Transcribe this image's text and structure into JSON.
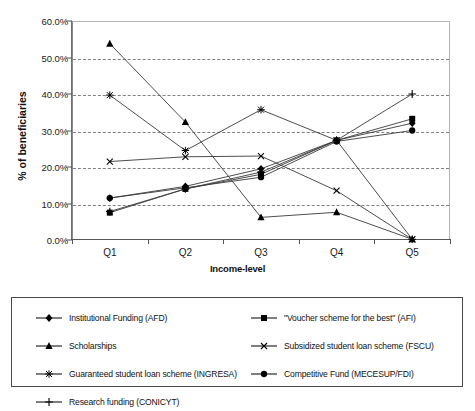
{
  "chart_data": {
    "type": "line",
    "title": "",
    "xlabel": "Income-level",
    "ylabel": "% of beneficiaries",
    "categories": [
      "Q1",
      "Q2",
      "Q3",
      "Q4",
      "Q5"
    ],
    "ylim": [
      0,
      60
    ],
    "ytick_labels": [
      "0.0%",
      "10.0%",
      "20.0%",
      "30.0%",
      "40.0%",
      "50.0%",
      "60.0%"
    ],
    "ytick_values": [
      0,
      10,
      20,
      30,
      40,
      50,
      60
    ],
    "grid": true,
    "legend_position": "bottom",
    "series": [
      {
        "name": "Institutional Funding (AFD)",
        "marker": "diamond",
        "values": [
          11.5,
          14.7,
          19.5,
          27.3,
          32.0
        ]
      },
      {
        "name": "\"Voucher scheme for the best\" (AFI)",
        "marker": "square",
        "values": [
          7.5,
          14.0,
          18.0,
          27.3,
          33.2
        ]
      },
      {
        "name": "Scholarships",
        "marker": "triangle",
        "values": [
          53.8,
          32.3,
          6.2,
          7.6,
          0.2
        ]
      },
      {
        "name": "Subsidized student loan scheme (FSCU)",
        "marker": "cross",
        "values": [
          21.5,
          22.8,
          23.0,
          13.5,
          0.2
        ]
      },
      {
        "name": "Guaranteed student loan scheme (INGRESA)",
        "marker": "star",
        "values": [
          39.7,
          24.5,
          35.7,
          27.3,
          0.2
        ]
      },
      {
        "name": "Competitive Fund (MECESUP/FDI)",
        "marker": "circle",
        "values": [
          11.5,
          14.3,
          17.2,
          27.0,
          30.0
        ]
      },
      {
        "name": "Research funding (CONICYT)",
        "marker": "plus",
        "values": [
          7.8,
          14.0,
          18.6,
          27.3,
          40.0
        ]
      }
    ]
  }
}
